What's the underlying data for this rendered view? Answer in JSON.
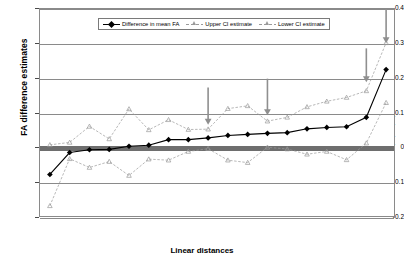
{
  "chart_data": {
    "type": "line",
    "title": "",
    "xlabel": "Linear distances",
    "ylabel": "FA difference estimates",
    "ylim": [
      -0.2,
      0.4
    ],
    "yticks": [
      0.4,
      0.3,
      0.2,
      0.1,
      0,
      -0.1,
      -0.2
    ],
    "ytick_labels": [
      "0.4",
      "0.3",
      "0.2",
      "0.1",
      "0",
      "-0.1",
      "-0.2"
    ],
    "grid": "horizontal",
    "legend_position": "top-center",
    "zero_reference_line": 0,
    "categories": [
      "9(20)",
      "8(19)-2",
      "15(26)-8(20)",
      "9(20)-3",
      "12(23)-2",
      "9(20)-6",
      "15(26)-2",
      "8(19)-6",
      "8(19)-3",
      "12(23)-8(19)",
      "12(23)-9(20)",
      "9(20)-8(19)",
      "15(26)-8(19)",
      "15(26)-3",
      "15(26)-5",
      "12(23)-6",
      "12(23)-3",
      "15(26)-12(23)"
    ],
    "series": [
      {
        "name": "Difference in mean FA",
        "color": "#000000",
        "marker": "diamond",
        "values": [
          -0.075,
          -0.012,
          -0.004,
          -0.003,
          0.006,
          0.009,
          0.025,
          0.025,
          0.03,
          0.037,
          0.04,
          0.043,
          0.045,
          0.056,
          0.06,
          0.062,
          0.089,
          0.226
        ]
      },
      {
        "name": "Upper CI estimate",
        "color": "#9a9a9a",
        "marker": "triangle",
        "values": [
          0.01,
          0.017,
          0.063,
          0.027,
          0.113,
          0.053,
          0.082,
          0.054,
          0.055,
          0.114,
          0.122,
          0.078,
          0.089,
          0.119,
          0.135,
          0.146,
          0.165,
          0.303
        ]
      },
      {
        "name": "Lower CI estimate",
        "color": "#9a9a9a",
        "marker": "triangle",
        "values": [
          -0.165,
          -0.03,
          -0.055,
          -0.038,
          -0.078,
          -0.031,
          -0.034,
          -0.009,
          -0.001,
          -0.034,
          -0.041,
          0.003,
          -0.002,
          -0.017,
          -0.009,
          -0.033,
          0.015,
          0.131
        ]
      }
    ],
    "annotations": [
      {
        "name": "arrow-1",
        "category_index": 8,
        "label": "",
        "color": "#8f8f8f",
        "top_value": 0.175,
        "bottom_value": 0.068
      },
      {
        "name": "arrow-2",
        "category_index": 11,
        "label": "",
        "color": "#8f8f8f",
        "top_value": 0.2,
        "bottom_value": 0.095
      },
      {
        "name": "arrow-3",
        "category_index": 16,
        "label": "",
        "color": "#8f8f8f",
        "top_value": 0.287,
        "bottom_value": 0.19
      },
      {
        "name": "arrow-4",
        "category_index": 17,
        "label": "",
        "color": "#8f8f8f",
        "top_value": 0.4,
        "bottom_value": 0.302
      }
    ]
  },
  "legend": {
    "items": [
      {
        "label": "Difference in mean FA"
      },
      {
        "label": "Upper CI estimate"
      },
      {
        "label": "Lower CI estimate"
      }
    ]
  }
}
